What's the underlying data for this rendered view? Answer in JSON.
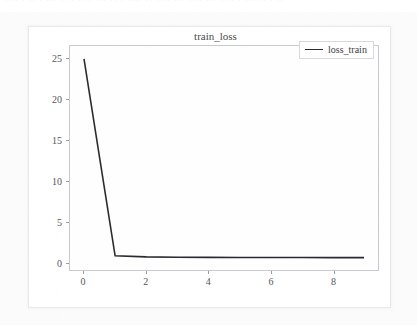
{
  "top_strip": {
    "text": "· ·· · ·· · ··· · ·· ·· · ··· ·· · ···· ·· · ·· ··· · ·· ··· · ·· · ··· ·· · ··"
  },
  "figure": {
    "title": "train_loss",
    "legend_label": "loss_train"
  },
  "colors": {
    "line": "#2b2b2f",
    "axis": "#c9c9cf",
    "tick": "#9a9aa2",
    "tick_label": "#55555a",
    "title": "#4a4a4f",
    "plot_bg": "#fefeff",
    "card_bg": "#ffffff",
    "page_bg": "#fbfbfc"
  },
  "chart_data": {
    "type": "line",
    "title": "train_loss",
    "xlabel": "",
    "ylabel": "",
    "xlim": [
      -0.45,
      9.45
    ],
    "ylim": [
      -1.0,
      26.6
    ],
    "grid": false,
    "legend_position": "upper right",
    "xticks": [
      0,
      2,
      4,
      6,
      8
    ],
    "yticks": [
      0,
      5,
      10,
      15,
      20,
      25
    ],
    "series": [
      {
        "name": "loss_train",
        "color": "#2b2b2f",
        "linewidth": 1.6,
        "x": [
          0,
          1,
          2,
          3,
          4,
          5,
          6,
          7,
          8,
          9
        ],
        "values": [
          25.0,
          0.75,
          0.62,
          0.58,
          0.56,
          0.55,
          0.54,
          0.53,
          0.52,
          0.52
        ]
      }
    ]
  }
}
